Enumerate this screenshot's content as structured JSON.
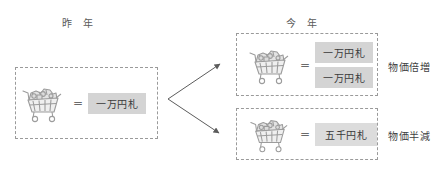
{
  "headers": {
    "last_year": "昨 年",
    "this_year": "今 年"
  },
  "equals_sign": "=",
  "panels": {
    "last_year": {
      "name": "last-year-panel",
      "cart_icon": "shopping-cart-icon",
      "notes": [
        "一万円札"
      ]
    },
    "price_double": {
      "name": "price-double-panel",
      "cart_icon": "shopping-cart-icon",
      "notes": [
        "一万円札",
        "一万円札"
      ]
    },
    "price_half": {
      "name": "price-half-panel",
      "cart_icon": "shopping-cart-icon",
      "notes": [
        "五千円札"
      ]
    }
  },
  "captions": {
    "price_double": "物価倍増",
    "price_half": "物価半減"
  },
  "colors": {
    "note_background": "#d4d4d4",
    "panel_border": "#9a9a9a",
    "arrow": "#5c5c5c",
    "text": "#3f3f3f",
    "header_text": "#5a5a5a"
  }
}
